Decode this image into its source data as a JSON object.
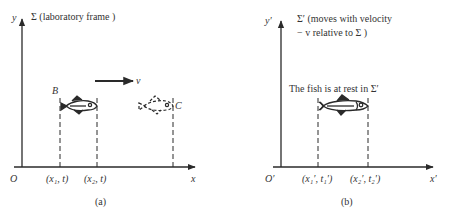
{
  "panel_a": {
    "caption": "(a)",
    "frame_label": "Σ (laboratory frame )",
    "y_axis_label": "y",
    "x_axis_label": "x",
    "origin_label": "O",
    "velocity_label": "v",
    "point_b_label": "B",
    "point_c_label": "C",
    "tick_labels": [
      "(x₁, t)",
      "(x₂, t)"
    ]
  },
  "panel_b": {
    "caption": "(b)",
    "frame_label_line1": "Σ′ (moves with velocity",
    "frame_label_line2": "− v relative to Σ )",
    "y_axis_label": "y′",
    "x_axis_label": "x′",
    "origin_label": "O′",
    "annotation": "The fish is at rest in Σ′",
    "tick_labels": [
      "(x₁′, t₁′)",
      "(x₂′, t₂′)"
    ]
  },
  "colors": {
    "ink": "#2a2a2a",
    "background": "#ffffff"
  }
}
